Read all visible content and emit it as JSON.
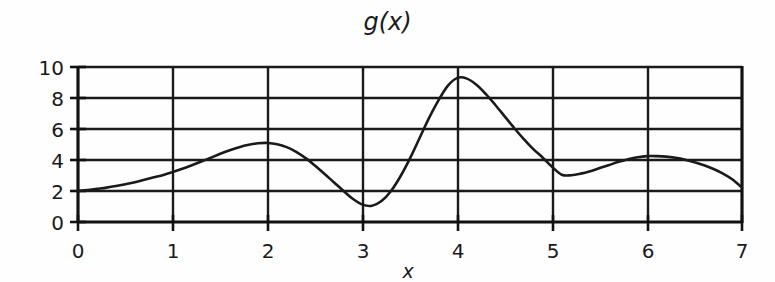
{
  "figure": {
    "title": "g(x)",
    "background_color": "#fefefe",
    "line_color": "#1a1a1a"
  },
  "axes": {
    "x_axis_label": "x",
    "y_axis_label": "",
    "x_ticks": [
      "0",
      "1",
      "2",
      "3",
      "4",
      "5",
      "6",
      "7"
    ],
    "y_ticks": [
      "0",
      "2",
      "4",
      "6",
      "8",
      "10"
    ]
  },
  "chart_data": {
    "type": "line",
    "title": "g(x)",
    "xlabel": "x",
    "ylabel": "",
    "xlim": [
      0,
      7
    ],
    "ylim": [
      0,
      10
    ],
    "xticks": [
      0,
      1,
      2,
      3,
      4,
      5,
      6,
      7
    ],
    "yticks": [
      0,
      2,
      4,
      6,
      8,
      10
    ],
    "grid": true,
    "grid_axis": "y",
    "legend": false,
    "series": [
      {
        "name": "g(x)",
        "color": "#1a1a1a",
        "x": [
          0.0,
          0.1,
          0.2,
          0.3,
          0.4,
          0.5,
          0.6,
          0.7,
          0.8,
          0.9,
          1.0,
          1.1,
          1.2,
          1.3,
          1.4,
          1.5,
          1.6,
          1.7,
          1.8,
          1.9,
          2.0,
          2.1,
          2.2,
          2.3,
          2.4,
          2.5,
          2.6,
          2.7,
          2.8,
          2.9,
          3.0,
          3.1,
          3.2,
          3.3,
          3.4,
          3.5,
          3.6,
          3.7,
          3.8,
          3.9,
          4.0,
          4.1,
          4.2,
          4.3,
          4.4,
          4.5,
          4.6,
          4.7,
          4.8,
          4.9,
          5.0,
          5.1,
          5.2,
          5.3,
          5.4,
          5.5,
          5.6,
          5.7,
          5.8,
          5.9,
          6.0,
          6.1,
          6.2,
          6.3,
          6.4,
          6.5,
          6.6,
          6.7,
          6.8,
          6.9,
          7.0
        ],
        "y": [
          2.0,
          2.06,
          2.14,
          2.22,
          2.32,
          2.44,
          2.57,
          2.72,
          2.88,
          3.04,
          3.22,
          3.43,
          3.66,
          3.9,
          4.15,
          4.4,
          4.63,
          4.83,
          4.98,
          5.08,
          5.1,
          5.02,
          4.83,
          4.53,
          4.12,
          3.63,
          3.1,
          2.55,
          2.0,
          1.48,
          1.12,
          1.05,
          1.35,
          2.0,
          2.95,
          4.1,
          5.4,
          6.7,
          7.85,
          8.8,
          9.3,
          9.25,
          8.85,
          8.25,
          7.55,
          6.8,
          6.05,
          5.35,
          4.7,
          4.15,
          3.55,
          3.05,
          3.02,
          3.12,
          3.28,
          3.48,
          3.68,
          3.88,
          4.05,
          4.18,
          4.25,
          4.25,
          4.22,
          4.14,
          4.02,
          3.86,
          3.66,
          3.42,
          3.12,
          2.74,
          2.22
        ]
      }
    ],
    "features": {
      "start_value": 2.0,
      "local_max_1": {
        "x": 1.9,
        "y": 5.1
      },
      "local_min_1": {
        "x": 3.05,
        "y": 1.05
      },
      "global_max": {
        "x": 4.0,
        "y": 9.3
      },
      "local_min_2": {
        "x": 5.15,
        "y": 3.0
      },
      "local_max_2": {
        "x": 6.0,
        "y": 4.25
      },
      "end_value": 2.22
    }
  }
}
